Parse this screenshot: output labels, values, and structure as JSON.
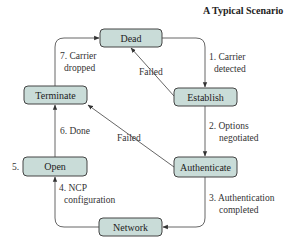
{
  "title": "A Typical Scenario",
  "colors": {
    "node_fill": "#c9dcd8",
    "node_stroke": "#444444",
    "edge": "#555555"
  },
  "nodes": {
    "dead": "Dead",
    "establish": "Establish",
    "authenticate": "Authenticate",
    "network": "Network",
    "open": "Open",
    "terminate": "Terminate"
  },
  "edges": {
    "carrier_detected": [
      "1. Carrier",
      "detected"
    ],
    "options_negotiated": [
      "2. Options",
      "negotiated"
    ],
    "auth_completed": [
      "3. Authentication",
      "completed"
    ],
    "ncp_config": [
      "4. NCP",
      "configuration"
    ],
    "open_step": "5.",
    "done": "6. Done",
    "carrier_dropped": [
      "7. Carrier",
      "dropped"
    ],
    "failed_establish": "Failed",
    "failed_authenticate": "Failed"
  }
}
